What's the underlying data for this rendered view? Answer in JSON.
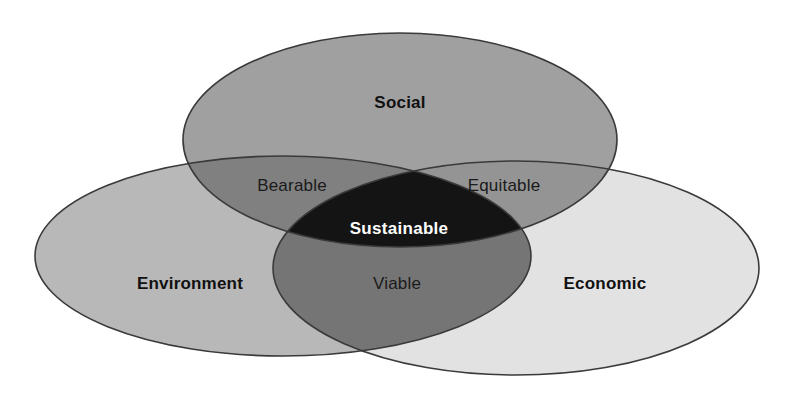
{
  "diagram": {
    "type": "venn-3-set",
    "background_color": "#ffffff",
    "outline_color": "#3a3a3a",
    "sets": [
      {
        "key": "social",
        "label": "Social",
        "fill_color": "#a0a0a0",
        "label_color": "#111111",
        "label_x": 400,
        "label_y": 104,
        "cx": 400,
        "cy": 140,
        "rx": 217,
        "ry": 107
      },
      {
        "key": "environment",
        "label": "Environment",
        "fill_color": "#b8b8b8",
        "label_color": "#111111",
        "label_x": 190,
        "label_y": 285,
        "cx": 283,
        "cy": 256,
        "rx": 248,
        "ry": 100
      },
      {
        "key": "economic",
        "label": "Economic",
        "fill_color": "#e2e2e2",
        "label_color": "#111111",
        "label_x": 605,
        "label_y": 285,
        "cx": 516,
        "cy": 268,
        "rx": 243,
        "ry": 107
      }
    ],
    "intersections": [
      {
        "key": "bearable",
        "label": "Bearable",
        "between": [
          "social",
          "environment"
        ],
        "fill_color": "#808080",
        "label_color": "#1a1a1a",
        "label_x": 292,
        "label_y": 187
      },
      {
        "key": "equitable",
        "label": "Equitable",
        "between": [
          "social",
          "economic"
        ],
        "fill_color": "#949494",
        "label_color": "#1a1a1a",
        "label_x": 504,
        "label_y": 187
      },
      {
        "key": "viable",
        "label": "Viable",
        "between": [
          "environment",
          "economic"
        ],
        "fill_color": "#757575",
        "label_color": "#1a1a1a",
        "label_x": 397,
        "label_y": 285
      }
    ],
    "center": {
      "key": "sustainable",
      "label": "Sustainable",
      "between": [
        "social",
        "environment",
        "economic"
      ],
      "fill_color": "#141414",
      "label_color": "#ffffff",
      "label_x": 399,
      "label_y": 230
    }
  }
}
